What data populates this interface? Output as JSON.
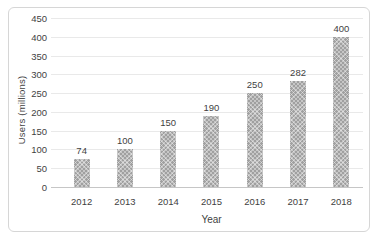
{
  "chart_data": {
    "type": "bar",
    "categories": [
      "2012",
      "2013",
      "2014",
      "2015",
      "2016",
      "2017",
      "2018"
    ],
    "values": [
      74,
      100,
      150,
      190,
      250,
      282,
      400
    ],
    "data_labels": [
      "74",
      "100",
      "150",
      "190",
      "250",
      "282",
      "400"
    ],
    "title": "",
    "xlabel": "Year",
    "ylabel": "Users (millions)",
    "ylim": [
      0,
      450
    ],
    "yticks": [
      0,
      50,
      100,
      150,
      200,
      250,
      300,
      350,
      400,
      450
    ],
    "grid": "horizontal",
    "legend": "none",
    "colors": {
      "bar_fill": "#a0a0a0",
      "bar_pattern": "light-diagonal-crosshatch",
      "gridline": "#e9e9e9",
      "axis_line": "#c6c6c6",
      "text": "#3f3f3f",
      "frame_border": "#d6d6d6",
      "background": "#ffffff"
    }
  }
}
